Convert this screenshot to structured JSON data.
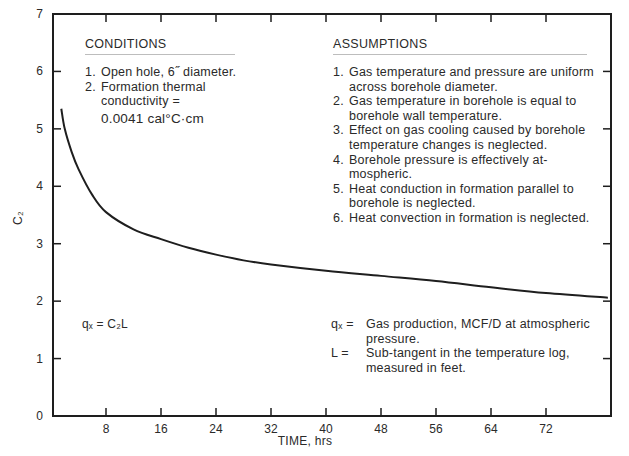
{
  "chart_data": {
    "type": "line",
    "title": "",
    "xlabel": "TIME, hrs",
    "ylabel": "C₂",
    "xlim": [
      0,
      81
    ],
    "ylim": [
      0,
      7
    ],
    "xticks": [
      8,
      16,
      24,
      32,
      40,
      48,
      56,
      64,
      72
    ],
    "yticks": [
      0,
      1,
      2,
      3,
      4,
      5,
      6,
      7
    ],
    "grid": false,
    "series": [
      {
        "name": "C₂ vs time",
        "x": [
          1.5,
          2,
          3,
          4,
          6,
          8,
          12,
          16,
          20,
          24,
          28,
          32,
          40,
          48,
          56,
          64,
          72,
          81
        ],
        "y": [
          5.35,
          5.0,
          4.6,
          4.3,
          3.85,
          3.55,
          3.25,
          3.08,
          2.93,
          2.81,
          2.71,
          2.64,
          2.53,
          2.44,
          2.35,
          2.24,
          2.14,
          2.06
        ]
      }
    ]
  },
  "conditions": {
    "heading": "CONDITIONS",
    "items": [
      {
        "num": "1.",
        "lines": [
          "Open hole, 6˝ diameter."
        ]
      },
      {
        "num": "2.",
        "lines": [
          "Formation thermal",
          "conductivity ="
        ]
      }
    ],
    "value": "0.0041 cal°C·cm"
  },
  "assumptions": {
    "heading": "ASSUMPTIONS",
    "items": [
      {
        "num": "1.",
        "text": "Gas temperature and pressure are uniform across borehole diameter."
      },
      {
        "num": "2.",
        "text": "Gas temperature in borehole is equal to borehole wall temperature."
      },
      {
        "num": "3.",
        "text": "Effect on gas cooling caused by borehole temperature changes is neglected."
      },
      {
        "num": "4.",
        "text": "Borehole pressure is effectively at-mospheric."
      },
      {
        "num": "5.",
        "text": "Heat conduction in formation parallel to borehole is neglected."
      },
      {
        "num": "6.",
        "text": "Heat convection in formation is neglected."
      }
    ]
  },
  "formula": {
    "text": "qₓ = C₂L"
  },
  "definitions": [
    {
      "term": "qₓ  =",
      "text": "Gas production, MCF/D at atmospheric pressure."
    },
    {
      "term": "L =",
      "text": "Sub-tangent in the temperature log, measured in feet."
    }
  ]
}
